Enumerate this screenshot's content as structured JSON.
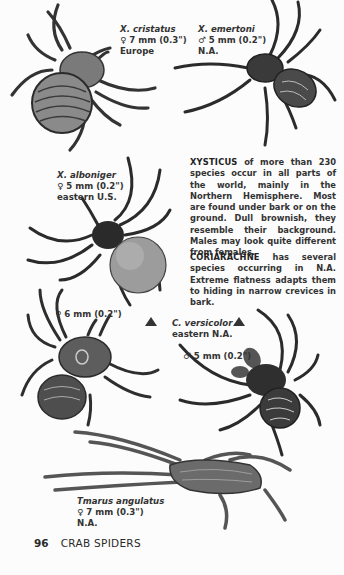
{
  "page": {
    "number": "96",
    "section_title": "CRAB SPIDERS"
  },
  "specimens": [
    {
      "name": "X. cristatus",
      "sex_symbol": "♀",
      "size": "7 mm (0.3\")",
      "range": "Europe"
    },
    {
      "name": "X. emertoni",
      "sex_symbol": "♂",
      "size": "5 mm (0.2\")",
      "range": "N.A."
    },
    {
      "name": "X. alboniger",
      "sex_symbol": "♀",
      "size": "5 mm (0.2\")",
      "range": "eastern U.S."
    },
    {
      "name": "",
      "sex_symbol": "♀",
      "size": "6 mm (0.2\")",
      "range": ""
    },
    {
      "name": "C. versicolor",
      "sex_symbol": "",
      "size": "",
      "range": "eastern N.A."
    },
    {
      "name": "",
      "sex_symbol": "♂",
      "size": "5 mm (0.2\")",
      "range": ""
    },
    {
      "name": "Tmarus angulatus",
      "sex_symbol": "♀",
      "size": "7 mm (0.3\")",
      "range": "N.A."
    }
  ],
  "paragraphs": [
    {
      "genus": "XYSTICUS",
      "text": " of more than 230 species occur in all parts of the world, mainly in the Northern Hemisphere. Most are found under bark or on the ground. Dull brownish, they resemble their background. Males may look quite different from females."
    },
    {
      "genus": "CORIARACHNE",
      "text": " has several species occurring in N.A. Extreme flatness adapts them to hiding in narrow crevices in bark."
    }
  ],
  "colors": {
    "paper": "#fcfcfc",
    "ink": "#2a2a2a",
    "illustration_dark": "#2b2b2b",
    "illustration_mid": "#6d6d6d",
    "abdomen_light": "#bdbdbd"
  }
}
